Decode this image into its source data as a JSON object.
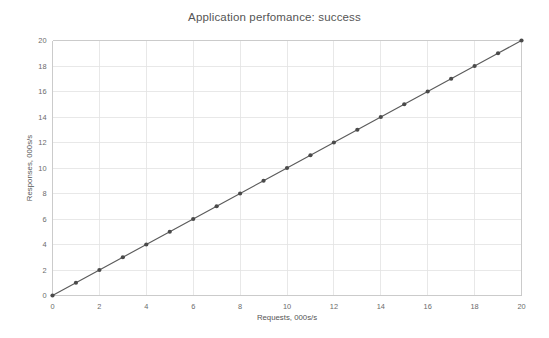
{
  "chart_data": {
    "type": "line",
    "title": "Application perfomance: success",
    "xlabel": "Requests, 000s/s",
    "ylabel": "Responses, 000s/s",
    "xlim": [
      0,
      20
    ],
    "ylim": [
      0,
      20
    ],
    "xticks": [
      0,
      2,
      4,
      6,
      8,
      10,
      12,
      14,
      16,
      18,
      20
    ],
    "yticks": [
      0,
      2,
      4,
      6,
      8,
      10,
      12,
      14,
      16,
      18,
      20
    ],
    "xtick_labels": [
      "0",
      "2",
      "4",
      "6",
      "8",
      "10",
      "12",
      "14",
      "16",
      "18",
      "20"
    ],
    "ytick_labels": [
      "0",
      "2",
      "4",
      "6",
      "8",
      "10",
      "12",
      "14",
      "16",
      "18",
      "20"
    ],
    "grid": true,
    "grid_x": true,
    "grid_y": true,
    "legend": false,
    "legend_position": "none",
    "marker": "circle",
    "line_color": "#5b5b5b",
    "marker_color": "#4a4a4a",
    "grid_color": "#e2e2e2",
    "axis_color": "#c8c8c8",
    "background": "#ffffff",
    "series": [
      {
        "name": "success",
        "x": [
          0,
          1,
          2,
          3,
          4,
          5,
          6,
          7,
          8,
          9,
          10,
          11,
          12,
          13,
          14,
          15,
          16,
          17,
          18,
          19,
          20
        ],
        "values": [
          0,
          1,
          2,
          3,
          4,
          5,
          6,
          7,
          8,
          9,
          10,
          11,
          12,
          13,
          14,
          15,
          16,
          17,
          18,
          19,
          20
        ]
      }
    ]
  }
}
